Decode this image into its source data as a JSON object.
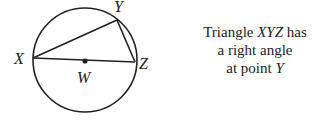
{
  "diagram": {
    "circle": {
      "cx": 85,
      "cy": 60,
      "r": 52
    },
    "points": {
      "X": {
        "x": 33,
        "y": 58,
        "label": "X"
      },
      "Y": {
        "x": 117,
        "y": 20,
        "label": "Y"
      },
      "Z": {
        "x": 135,
        "y": 62,
        "label": "Z"
      },
      "W": {
        "x": 85,
        "y": 61,
        "label": "W"
      }
    },
    "stroke_color": "#222222"
  },
  "caption": {
    "line1_prefix": "Triangle ",
    "line1_name": "XYZ",
    "line1_suffix": " has",
    "line2": "a right angle",
    "line3_prefix": "at point ",
    "line3_point": "Y"
  }
}
